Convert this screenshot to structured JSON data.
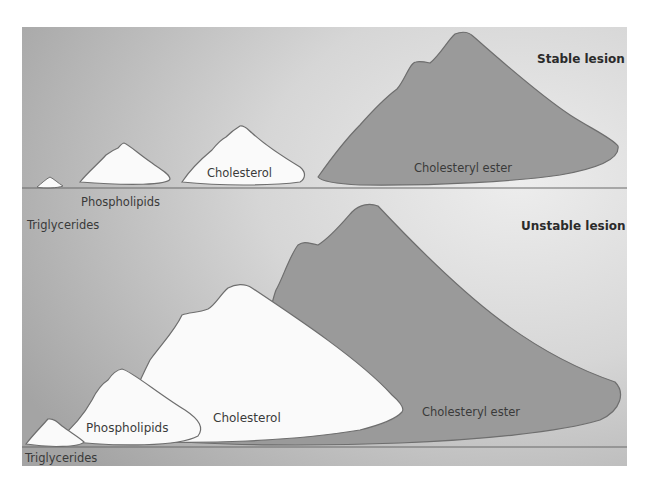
{
  "figure": {
    "colors": {
      "panel_dark": "#a8a8a8",
      "panel_light": "#e6e6e6",
      "white_mound": "#fafafa",
      "ester_mound": "#9a9a9a",
      "outline": "#6e6e6e",
      "baseline": "#6a6a6a"
    },
    "stable": {
      "title": "Stable lesion",
      "labels": {
        "triglycerides": "Triglycerides",
        "phospholipids": "Phospholipids",
        "cholesterol": "Cholesterol",
        "cholesteryl_ester": "Cholesteryl ester"
      }
    },
    "unstable": {
      "title": "Unstable lesion",
      "labels": {
        "triglycerides": "Triglycerides",
        "phospholipids": "Phospholipids",
        "cholesterol": "Cholesterol",
        "cholesteryl_ester": "Cholesteryl ester"
      }
    }
  }
}
